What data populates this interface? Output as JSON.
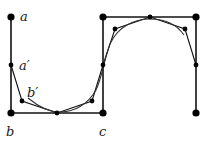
{
  "diagram": {
    "labels": {
      "a": "a",
      "a_prime": "a′",
      "b": "b",
      "b_prime": "b′",
      "c": "c"
    },
    "colors": {
      "line": "#111111",
      "curve": "#333333",
      "background": "#ffffff"
    },
    "large_points": [
      [
        11,
        17
      ],
      [
        11,
        113
      ],
      [
        103,
        113
      ],
      [
        103,
        17
      ],
      [
        196,
        17
      ],
      [
        196,
        113
      ]
    ],
    "small_points": [
      [
        11,
        65
      ],
      [
        22,
        101
      ],
      [
        57,
        113
      ],
      [
        92,
        101
      ],
      [
        103,
        65
      ],
      [
        115,
        29
      ],
      [
        150,
        17
      ],
      [
        185,
        29
      ],
      [
        196,
        65
      ]
    ]
  }
}
